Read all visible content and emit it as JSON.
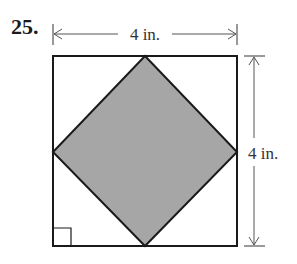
{
  "problem": {
    "number": "25.",
    "figure": {
      "type": "square-with-inscribed-diamond",
      "top_dimension_label": "4 in.",
      "right_dimension_label": "4 in.",
      "square_side": "4 in.",
      "shaded_region": "inscribed square (diamond) connecting midpoints of sides",
      "right_angle_marker": "bottom-left corner",
      "colors": {
        "outline": "#1a1a1a",
        "shaded_fill": "#a6a6a6",
        "dimension_lines": "#555555"
      }
    }
  }
}
